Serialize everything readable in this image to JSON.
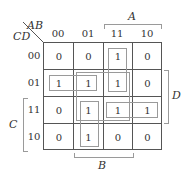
{
  "kmap": {
    "row_var": "CD",
    "col_var": "AB",
    "col_labels": [
      "00",
      "01",
      "11",
      "10"
    ],
    "row_labels": [
      "00",
      "01",
      "11",
      "10"
    ],
    "cells": [
      [
        "0",
        "0",
        "1",
        "0"
      ],
      [
        "1",
        "1",
        "1",
        "0"
      ],
      [
        "0",
        "1",
        "1",
        "1"
      ],
      [
        "0",
        "1",
        "0",
        "0"
      ]
    ],
    "brackets": {
      "A": "A",
      "B": "B",
      "C": "C",
      "D": "D"
    },
    "groups": [
      {
        "name": "row01-cols00-01",
        "rows": [
          1,
          1
        ],
        "cols": [
          0,
          1
        ]
      },
      {
        "name": "col11-rows00-01",
        "rows": [
          0,
          1
        ],
        "cols": [
          2,
          2
        ]
      },
      {
        "name": "quad-rows01-11-cols01-11",
        "rows": [
          1,
          2
        ],
        "cols": [
          1,
          2
        ]
      },
      {
        "name": "col01-rows11-10",
        "rows": [
          2,
          3
        ],
        "cols": [
          1,
          1
        ]
      },
      {
        "name": "row11-cols11-10",
        "rows": [
          2,
          2
        ],
        "cols": [
          2,
          3
        ]
      }
    ]
  }
}
